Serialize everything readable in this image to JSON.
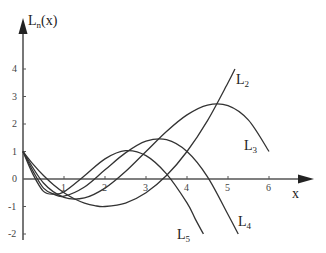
{
  "chart_data": {
    "type": "line",
    "title": "",
    "xlabel": "x",
    "ylabel": "L_n(x)",
    "xlim": [
      0,
      6.5
    ],
    "ylim": [
      -2,
      4.5
    ],
    "grid": false,
    "legend_position": "inline labels",
    "x_ticks": [
      "1",
      "2",
      "3",
      "4",
      "5",
      "6"
    ],
    "y_ticks": [
      "4",
      "3",
      "2",
      "1",
      "0",
      "-1",
      "-2"
    ],
    "series": [
      {
        "name": "L2",
        "label_main": "L",
        "label_sub": "2",
        "x": [
          0,
          0.25,
          0.5,
          0.75,
          1,
          1.25,
          1.5,
          1.75,
          2,
          2.5,
          3,
          3.5,
          4,
          4.5,
          5,
          5.17
        ],
        "values": [
          1,
          0.531,
          0.125,
          -0.219,
          -0.5,
          -0.719,
          -0.875,
          -0.969,
          -1,
          -0.875,
          -0.5,
          0.125,
          1,
          2.125,
          3.5,
          4.0
        ]
      },
      {
        "name": "L3",
        "label_main": "L",
        "label_sub": "3",
        "x": [
          0,
          0.5,
          1,
          1.5,
          2,
          2.5,
          3,
          3.5,
          4,
          4.5,
          5,
          5.5,
          6
        ],
        "values": [
          1,
          -0.146,
          -0.667,
          -0.688,
          -0.333,
          0.27,
          1,
          1.73,
          2.333,
          2.69,
          2.667,
          2.14,
          1
        ]
      },
      {
        "name": "L4",
        "label_main": "L",
        "label_sub": "4",
        "x": [
          0,
          0.25,
          0.5,
          0.75,
          1,
          1.5,
          2,
          2.5,
          3,
          3.5,
          4,
          4.5,
          5,
          5.25
        ],
        "values": [
          1,
          0.27,
          -0.33,
          -0.55,
          -0.625,
          -0.29,
          0.333,
          0.95,
          1.375,
          1.43,
          1,
          0.08,
          -1.29,
          -2.0
        ]
      },
      {
        "name": "L5",
        "label_main": "L",
        "label_sub": "5",
        "x": [
          0,
          0.25,
          0.5,
          0.75,
          1,
          1.5,
          2,
          2.5,
          3,
          3.5,
          4,
          4.2,
          4.4
        ],
        "values": [
          1,
          0.15,
          -0.45,
          -0.55,
          -0.467,
          0.117,
          0.733,
          1.03,
          0.85,
          0.185,
          -0.87,
          -1.45,
          -2.0
        ]
      }
    ]
  },
  "axis_labels": {
    "y_main": "L",
    "y_sub": "n",
    "y_rest": "(x)",
    "x": "x"
  }
}
